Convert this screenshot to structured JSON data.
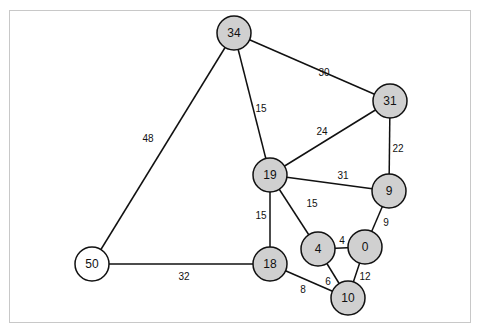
{
  "graph": {
    "title": "",
    "colors": {
      "visited_fill": "#d0d0d0",
      "unvisited_fill": "#ffffff",
      "stroke": "#111111"
    },
    "nodes": [
      {
        "id": "34",
        "label": "34",
        "state": "visited"
      },
      {
        "id": "31",
        "label": "31",
        "state": "visited"
      },
      {
        "id": "19",
        "label": "19",
        "state": "visited"
      },
      {
        "id": "9",
        "label": "9",
        "state": "visited"
      },
      {
        "id": "0",
        "label": "0",
        "state": "visited"
      },
      {
        "id": "4",
        "label": "4",
        "state": "visited"
      },
      {
        "id": "18",
        "label": "18",
        "state": "visited"
      },
      {
        "id": "10",
        "label": "10",
        "state": "visited"
      },
      {
        "id": "50",
        "label": "50",
        "state": "unvisited"
      }
    ],
    "edges": [
      {
        "from": "34",
        "to": "50",
        "weight": "48"
      },
      {
        "from": "34",
        "to": "31",
        "weight": "30"
      },
      {
        "from": "34",
        "to": "19",
        "weight": "15"
      },
      {
        "from": "31",
        "to": "19",
        "weight": "24"
      },
      {
        "from": "31",
        "to": "9",
        "weight": "22"
      },
      {
        "from": "19",
        "to": "9",
        "weight": "31"
      },
      {
        "from": "19",
        "to": "4",
        "weight": "15"
      },
      {
        "from": "19",
        "to": "18",
        "weight": "15"
      },
      {
        "from": "9",
        "to": "0",
        "weight": "9"
      },
      {
        "from": "4",
        "to": "0",
        "weight": "4"
      },
      {
        "from": "4",
        "to": "10",
        "weight": "6"
      },
      {
        "from": "0",
        "to": "10",
        "weight": "12"
      },
      {
        "from": "18",
        "to": "10",
        "weight": "8"
      },
      {
        "from": "50",
        "to": "18",
        "weight": "32"
      }
    ]
  }
}
